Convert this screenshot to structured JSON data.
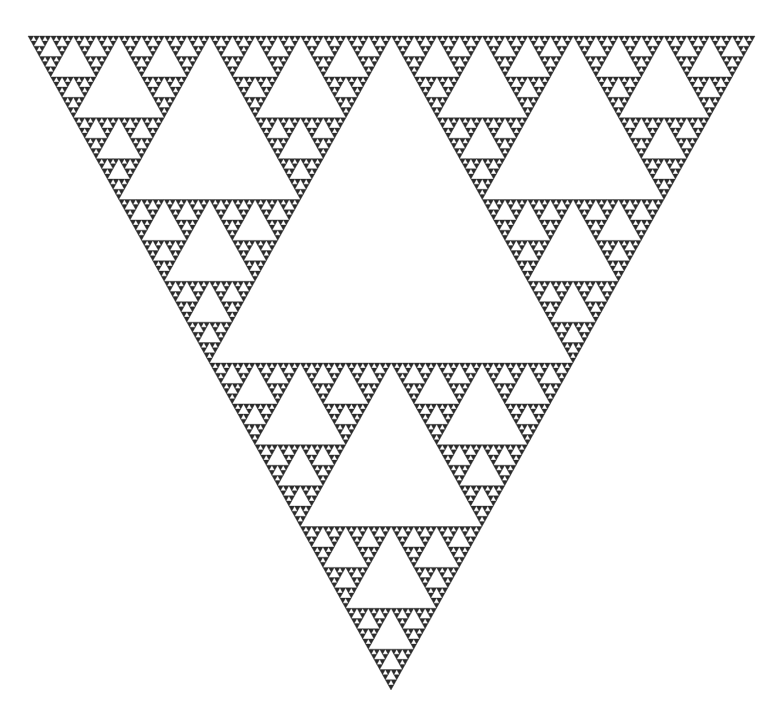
{
  "figure": {
    "type": "sierpinski-triangle",
    "orientation": "pointing-down",
    "caption_cropped": "",
    "vertices": {
      "top_left": [
        28,
        36
      ],
      "top_right": [
        755,
        36
      ],
      "bottom": [
        391,
        690
      ]
    },
    "depth": 7,
    "colors": {
      "background": "#ffffff",
      "fill": "#2b2b2b",
      "hole": "#ffffff"
    }
  }
}
